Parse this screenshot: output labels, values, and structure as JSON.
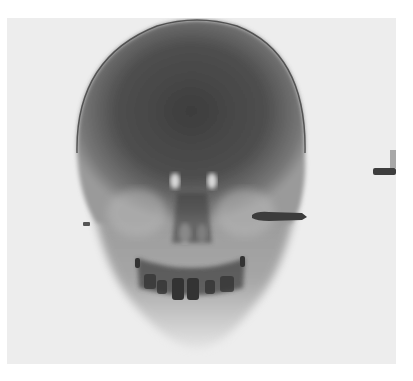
{
  "image": {
    "subject": "frontal skull radiograph",
    "description": "Grayscale X-ray of a human skull, frontal (AP) view, with a bullet-shaped metallic foreign body lateral to the right orbit/zygoma and a small fragment on the left side",
    "colors": {
      "background": "#ffffff",
      "film": "#ededed",
      "bone_dark": "#3a3a3a",
      "bone_mid": "#6a6a6a",
      "bright_spots": "#f0f0f0"
    }
  }
}
